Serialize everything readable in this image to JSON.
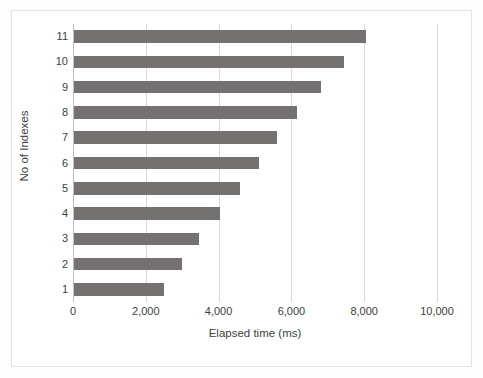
{
  "chart_data": {
    "type": "bar",
    "orientation": "horizontal",
    "title": "",
    "xlabel": "Elapsed time (ms)",
    "ylabel": "No of Indexes",
    "categories": [
      "1",
      "2",
      "3",
      "4",
      "5",
      "6",
      "7",
      "8",
      "9",
      "10",
      "11"
    ],
    "values": [
      2500,
      3000,
      3450,
      4050,
      4600,
      5100,
      5600,
      6150,
      6800,
      7450,
      8050
    ],
    "series": [
      {
        "name": "Elapsed time (ms)",
        "values": [
          2500,
          3000,
          3450,
          4050,
          4600,
          5100,
          5600,
          6150,
          6800,
          7450,
          8050
        ]
      }
    ],
    "xlim": [
      0,
      10000
    ],
    "xticks": [
      0,
      2000,
      4000,
      6000,
      8000,
      10000
    ],
    "xtick_labels": [
      "0",
      "2,000",
      "4,000",
      "6,000",
      "8,000",
      "10,000"
    ],
    "ytick_labels": [
      "11",
      "10",
      "9",
      "8",
      "7",
      "6",
      "5",
      "4",
      "3",
      "2",
      "1"
    ],
    "grid": true,
    "grid_axis": "x",
    "legend": false,
    "legend_position": "none",
    "bar_color": "#767171",
    "gridline_color": "#d9d9d9",
    "axis_color": "#bfbfbf",
    "text_color": "#404040",
    "plot_background": "#ffffff"
  }
}
